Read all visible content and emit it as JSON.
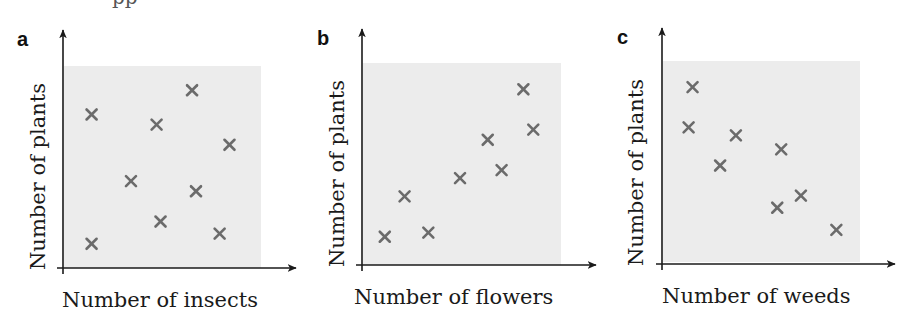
{
  "figure": {
    "top_cut_text": "pp"
  },
  "chart_data": [
    {
      "type": "scatter",
      "panel": "a",
      "title": "",
      "xlabel": "Number of insects",
      "ylabel": "Number of plants",
      "xlim": [
        0,
        10
      ],
      "ylim": [
        0,
        10
      ],
      "grid": false,
      "ticks": false,
      "marker": "x",
      "correlation": "none",
      "points": [
        {
          "x": 1.4,
          "y": 7.6
        },
        {
          "x": 4.7,
          "y": 7.1
        },
        {
          "x": 6.5,
          "y": 8.8
        },
        {
          "x": 8.4,
          "y": 6.1
        },
        {
          "x": 3.4,
          "y": 4.3
        },
        {
          "x": 6.7,
          "y": 3.8
        },
        {
          "x": 4.9,
          "y": 2.3
        },
        {
          "x": 7.9,
          "y": 1.7
        },
        {
          "x": 1.4,
          "y": 1.2
        }
      ]
    },
    {
      "type": "scatter",
      "panel": "b",
      "title": "",
      "xlabel": "Number of flowers",
      "ylabel": "Number of plants",
      "xlim": [
        0,
        10
      ],
      "ylim": [
        0,
        10
      ],
      "grid": false,
      "ticks": false,
      "marker": "x",
      "correlation": "positive",
      "points": [
        {
          "x": 1.1,
          "y": 1.4
        },
        {
          "x": 2.1,
          "y": 3.4
        },
        {
          "x": 3.3,
          "y": 1.6
        },
        {
          "x": 4.9,
          "y": 4.3
        },
        {
          "x": 6.3,
          "y": 6.2
        },
        {
          "x": 7.0,
          "y": 4.7
        },
        {
          "x": 8.1,
          "y": 8.7
        },
        {
          "x": 8.6,
          "y": 6.7
        }
      ]
    },
    {
      "type": "scatter",
      "panel": "c",
      "title": "",
      "xlabel": "Number of weeds",
      "ylabel": "Number of plants",
      "xlim": [
        0,
        10
      ],
      "ylim": [
        0,
        10
      ],
      "grid": false,
      "ticks": false,
      "marker": "x",
      "correlation": "negative",
      "points": [
        {
          "x": 1.5,
          "y": 8.7
        },
        {
          "x": 1.3,
          "y": 6.7
        },
        {
          "x": 3.7,
          "y": 6.3
        },
        {
          "x": 2.9,
          "y": 4.8
        },
        {
          "x": 6.0,
          "y": 5.6
        },
        {
          "x": 7.0,
          "y": 3.3
        },
        {
          "x": 5.8,
          "y": 2.7
        },
        {
          "x": 8.8,
          "y": 1.6
        }
      ]
    }
  ]
}
